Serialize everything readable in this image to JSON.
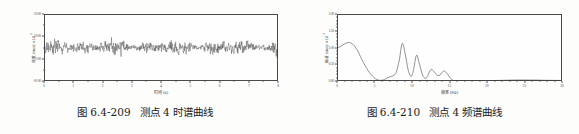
{
  "page": {
    "background": "#fdfdfc",
    "ink": "#2e2e2e"
  },
  "figures": [
    {
      "id": "fig-left",
      "caption_number": "图 6.4-209",
      "caption_text": "测点 4 时谱曲线"
    },
    {
      "id": "fig-right",
      "caption_number": "图 6.4-210",
      "caption_text": "测点 4 频谱曲线"
    }
  ],
  "chart_data": [
    {
      "type": "line",
      "id": "time-history",
      "title": "测点 4 时谱曲线",
      "xlabel": "时间 (s)",
      "ylabel": "速度 (m/s) ×10",
      "ylabel_exponent": "-2",
      "xlim": [
        0,
        8
      ],
      "ylim": [
        -10.0,
        20.0
      ],
      "xticks": [
        0,
        1,
        2,
        3,
        4,
        5,
        6,
        7,
        8
      ],
      "xticklabels": [
        "0",
        "1",
        "2",
        "3",
        "4",
        "5",
        "6",
        "7",
        "8"
      ],
      "yticks": [
        -10.0,
        0.0,
        10.0,
        20.0
      ],
      "yticklabels": [
        "-10.00",
        "0.00",
        "10.00",
        "20.00"
      ],
      "grid": false,
      "legend": null,
      "line_color": "#3a3a3a",
      "description": "Dense random vibration waveform, mean near 5.0, amplitude band roughly 0.5 to 10.5",
      "mean_level": 5.0,
      "amplitude_range": [
        0.3,
        10.6
      ],
      "n_samples": 760
    },
    {
      "type": "line",
      "id": "frequency-spectrum",
      "title": "测点 4 频谱曲线",
      "xlabel": "频率 (Hz)",
      "ylabel": "幅值 (m/s) ×10",
      "ylabel_exponent": "-3",
      "xlim": [
        0,
        30
      ],
      "ylim": [
        0.0,
        2.0
      ],
      "xticks": [
        0,
        5,
        10,
        15,
        20,
        25,
        30
      ],
      "xticklabels": [
        "0",
        "5",
        "10",
        "15",
        "20",
        "25",
        "30"
      ],
      "yticks": [
        0.0,
        0.5,
        1.0,
        1.5,
        2.0
      ],
      "yticklabels": [
        "0.00",
        "0.50",
        "1.00",
        "1.50",
        "2.00"
      ],
      "grid": false,
      "legend": null,
      "line_color": "#3a3a3a",
      "peaks": [
        {
          "x": 1.5,
          "y": 1.15
        },
        {
          "x": 8.7,
          "y": 1.12
        },
        {
          "x": 10.6,
          "y": 0.77
        },
        {
          "x": 12.5,
          "y": 0.34
        },
        {
          "x": 14.3,
          "y": 0.3
        }
      ],
      "x": [
        0.0,
        0.4,
        0.8,
        1.2,
        1.5,
        1.9,
        2.3,
        2.7,
        3.1,
        3.5,
        3.9,
        4.3,
        4.7,
        5.1,
        5.5,
        5.9,
        6.3,
        6.7,
        7.1,
        7.5,
        7.9,
        8.3,
        8.7,
        9.1,
        9.5,
        9.9,
        10.2,
        10.6,
        11.0,
        11.4,
        11.8,
        12.1,
        12.5,
        12.9,
        13.3,
        13.7,
        14.0,
        14.3,
        14.7,
        15.1,
        15.5,
        16.0,
        17.0,
        18.0,
        19.0,
        20.0,
        21.0,
        22.0,
        23.0,
        24.0,
        25.0,
        26.0,
        27.0,
        28.0,
        29.0,
        30.0
      ],
      "y": [
        1.0,
        1.02,
        1.08,
        1.13,
        1.15,
        1.13,
        1.05,
        0.92,
        0.74,
        0.56,
        0.4,
        0.26,
        0.15,
        0.07,
        0.03,
        0.02,
        0.04,
        0.09,
        0.13,
        0.16,
        0.26,
        0.62,
        1.12,
        0.8,
        0.32,
        0.14,
        0.33,
        0.77,
        0.5,
        0.18,
        0.08,
        0.16,
        0.34,
        0.29,
        0.18,
        0.17,
        0.25,
        0.3,
        0.22,
        0.09,
        0.02,
        0.01,
        0.01,
        0.01,
        0.01,
        0.01,
        0.015,
        0.02,
        0.025,
        0.03,
        0.03,
        0.028,
        0.025,
        0.02,
        0.018,
        0.015
      ]
    }
  ]
}
